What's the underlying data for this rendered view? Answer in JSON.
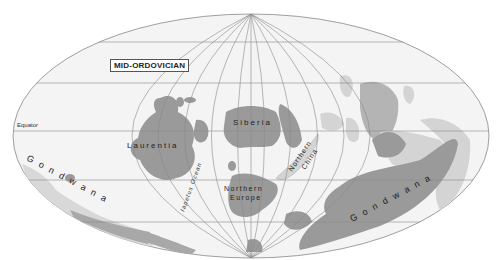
{
  "map": {
    "title": "MID-ORDOVICIAN",
    "equator_label": "Equator",
    "continents": {
      "laurentia": "Laurentia",
      "siberia": "Siberia",
      "northern_europe_1": "Northern",
      "northern_europe_2": "Europe",
      "northern_china_1": "Northern",
      "northern_china_2": "China",
      "gondwana_west": "G o n d w a n a",
      "gondwana_east": "G o n d w a n a",
      "iapetus": "Iapetus Ocean"
    },
    "colors": {
      "land_dark": "#9a9a9a",
      "land_light": "#d4d4d4",
      "ocean": "#f4f4f4",
      "grid": "#8a8a8a"
    }
  }
}
